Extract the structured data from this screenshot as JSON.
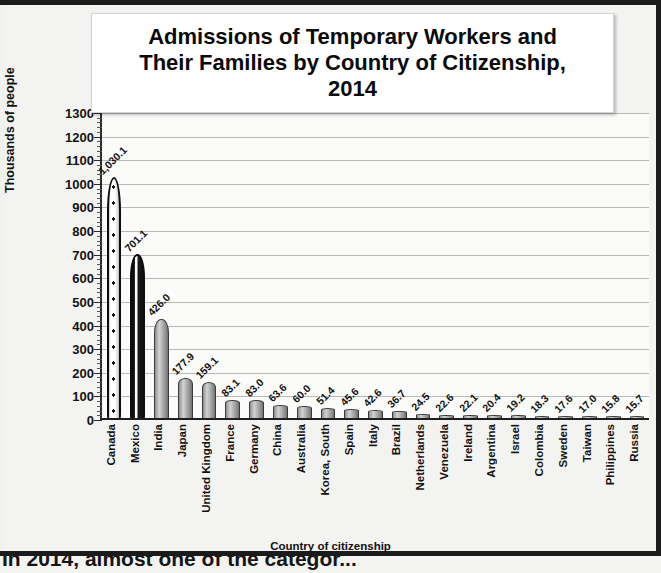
{
  "figure": {
    "title_lines": [
      "Admissions of Temporary Workers and",
      "Their Families by Country of Citizenship,",
      "2014"
    ],
    "xaxis_title": "Country of citizenship",
    "yaxis_title": "Thousands of people"
  },
  "body_text_partial": "In 2014, almost one of the categor...",
  "colors": {
    "bar_gray": "#b0b0b0",
    "bar_edge": "#3a3a3a",
    "canada_fill": "#ffffff",
    "mexico_fill": "#101010",
    "gridline": "#b9b9b9",
    "axis": "#1f1f1f",
    "background": "#f1f1ef",
    "title_box": "#ffffff"
  },
  "chart_data": {
    "type": "bar",
    "xlabel": "Country of citizenship",
    "ylabel": "Thousands of people",
    "ylim": [
      0,
      1300
    ],
    "ytick_step": 100,
    "yminor_step": 20,
    "grid": true,
    "legend": "none",
    "yticks": [
      0,
      100,
      200,
      300,
      400,
      500,
      600,
      700,
      800,
      900,
      1000,
      1100,
      1200,
      1300
    ],
    "ytick_labels": [
      "0",
      "100",
      "200",
      "300",
      "400",
      "500",
      "600",
      "700",
      "800",
      "900",
      "1000",
      "1100",
      "1200",
      "1300"
    ],
    "categories": [
      "Canada",
      "Mexico",
      "India",
      "Japan",
      "United Kingdom",
      "France",
      "Germany",
      "China",
      "Australia",
      "Korea, South",
      "Spain",
      "Italy",
      "Brazil",
      "Netherlands",
      "Venezuela",
      "Ireland",
      "Argentina",
      "Israel",
      "Colombia",
      "Sweden",
      "Taiwan",
      "Philippines",
      "Russia"
    ],
    "values": [
      1030.1,
      701.1,
      426.0,
      177.9,
      159.1,
      83.1,
      83.0,
      63.6,
      60.0,
      51.4,
      45.6,
      42.6,
      36.7,
      24.5,
      22.6,
      22.1,
      20.4,
      19.2,
      18.3,
      17.6,
      17.0,
      15.8,
      15.7
    ],
    "value_labels": [
      "1,030.1",
      "701.1",
      "426.0",
      "177.9",
      "159.1",
      "83.1",
      "83.0",
      "63.6",
      "60.0",
      "51.4",
      "45.6",
      "42.6",
      "36.7",
      "24.5",
      "22.6",
      "22.1",
      "20.4",
      "19.2",
      "18.3",
      "17.6",
      "17.0",
      "15.8",
      "15.7"
    ],
    "bar_styles": [
      "maple-leaf-pattern",
      "vertical-stripe",
      "solid-gray",
      "solid-gray",
      "solid-gray",
      "solid-gray",
      "solid-gray",
      "solid-gray",
      "solid-gray",
      "solid-gray",
      "solid-gray",
      "solid-gray",
      "solid-gray",
      "solid-gray",
      "solid-gray",
      "solid-gray",
      "solid-gray",
      "solid-gray",
      "solid-gray",
      "solid-gray",
      "solid-gray",
      "solid-gray",
      "solid-gray"
    ]
  }
}
